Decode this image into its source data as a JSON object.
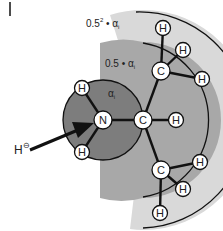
{
  "diagram": {
    "type": "molecular-polarizability-attenuation",
    "regions": [
      {
        "name": "outer-shell",
        "label_base": "0.5",
        "label_exp": "2",
        "label_suffix": " • α",
        "label_sub": "i",
        "color": "#d9d9d9"
      },
      {
        "name": "middle-shell",
        "label_base": "0.5",
        "label_suffix": " • α",
        "label_sub": "i",
        "color": "#a8a8a8"
      },
      {
        "name": "inner-shell",
        "label": "α",
        "label_sub": "i",
        "color": "#7d7d7d"
      }
    ],
    "atoms": {
      "n": "N",
      "c_center": "C",
      "c_upper": "C",
      "c_lower": "C",
      "h": "H"
    },
    "attacker": {
      "label": "H",
      "charge": "⊖"
    },
    "colors": {
      "bond": "#111111",
      "atom_fill": "#ffffff",
      "atom_stroke": "#111111",
      "arrow": "#111111"
    }
  }
}
